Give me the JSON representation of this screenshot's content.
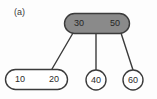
{
  "figure": {
    "panel_label": "(a)",
    "background_color": "#fdfdfd",
    "edge_color": "#3b3b3b"
  },
  "colors": {
    "root_fill": "#8a8a8a",
    "root_stroke": "#3b3b3b",
    "leaf_fill": "#ffffff",
    "leaf_stroke": "#3b3b3b",
    "text": "#262626"
  },
  "tree": {
    "root": {
      "shape": "rounded-rect",
      "fill": "#8a8a8a",
      "keys": [
        "30",
        "50"
      ],
      "key_left": "30",
      "key_right": "50"
    },
    "leaves": [
      {
        "id": "leaf-10-20",
        "shape": "rounded-rect",
        "fill": "#ffffff",
        "keys": [
          "10",
          "20"
        ],
        "key_left": "10",
        "key_right": "20"
      },
      {
        "id": "leaf-40",
        "shape": "circle",
        "fill": "#ffffff",
        "keys": [
          "40"
        ],
        "key_left": "40"
      },
      {
        "id": "leaf-60",
        "shape": "circle",
        "fill": "#ffffff",
        "keys": [
          "60"
        ],
        "key_left": "60"
      }
    ],
    "edges": [
      {
        "id": "edge-root-left",
        "from": "root",
        "to": "leaf-10-20"
      },
      {
        "id": "edge-root-middle",
        "from": "root",
        "to": "leaf-40"
      },
      {
        "id": "edge-root-right",
        "from": "root",
        "to": "leaf-60"
      }
    ]
  }
}
